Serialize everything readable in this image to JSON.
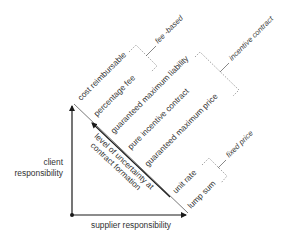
{
  "diagram": {
    "axes": {
      "vertical_label_line1": "client",
      "vertical_label_line2": "responsibility",
      "horizontal_label": "supplier responsibility"
    },
    "inner_arrow": {
      "label_line1": "level of uncertainty at",
      "label_line2": "contract formation"
    },
    "contract_types": [
      {
        "label": "cost reimbursable"
      },
      {
        "label": "percentage fee"
      },
      {
        "label": "guaranteed maximum liability"
      },
      {
        "label": "pure incentive contract"
      },
      {
        "label": "guaranteed maximum price"
      },
      {
        "label": "unit rate"
      },
      {
        "label": "lump sum"
      }
    ],
    "groups": [
      {
        "label": "fee -based",
        "members": [
          "cost reimbursable",
          "percentage fee"
        ]
      },
      {
        "label": "incentive contract",
        "members": [
          "guaranteed maximum liability",
          "pure incentive contract",
          "guaranteed maximum price"
        ]
      },
      {
        "label": "fixed price",
        "members": [
          "unit rate",
          "lump sum"
        ]
      }
    ],
    "colors": {
      "axis": "#1a1a1a",
      "text": "#333333",
      "bracket": "#8a8a8a"
    }
  }
}
